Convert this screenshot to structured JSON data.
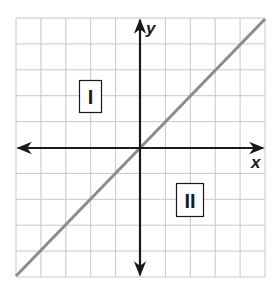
{
  "diagram": {
    "type": "coordinate-plane",
    "grid": {
      "columns": 10,
      "rows": 10,
      "color": "#c8c8c8"
    },
    "axes": {
      "x_label": "x",
      "y_label": "y",
      "color": "#1a1a1a"
    },
    "line": {
      "description": "line through origin with positive slope (y = x)",
      "color": "#8c8c8c"
    },
    "regions": [
      {
        "label": "I",
        "position": "above-left of line"
      },
      {
        "label": "II",
        "position": "below-right of line"
      }
    ]
  }
}
